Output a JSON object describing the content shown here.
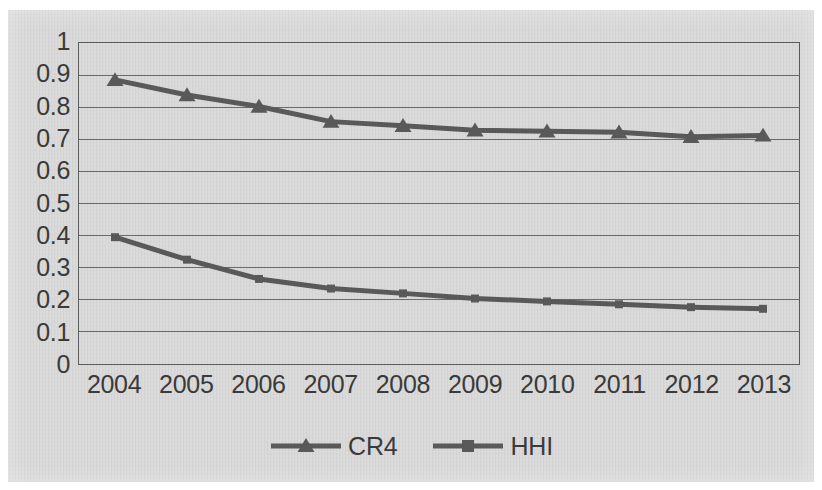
{
  "chart_data": {
    "type": "line",
    "title": "",
    "xlabel": "",
    "ylabel": "",
    "categories": [
      "2004",
      "2005",
      "2006",
      "2007",
      "2008",
      "2009",
      "2010",
      "2011",
      "2012",
      "2013"
    ],
    "series": [
      {
        "name": "CR4",
        "marker": "triangle",
        "color": "#595959",
        "values": [
          0.885,
          0.838,
          0.802,
          0.755,
          0.742,
          0.728,
          0.725,
          0.722,
          0.708,
          0.712
        ]
      },
      {
        "name": "HHI",
        "marker": "square",
        "color": "#595959",
        "values": [
          0.395,
          0.325,
          0.265,
          0.235,
          0.22,
          0.204,
          0.195,
          0.186,
          0.177,
          0.172
        ]
      }
    ],
    "ylim": [
      0,
      1
    ],
    "ytick_labels": [
      "1",
      "0.9",
      "0.8",
      "0.7",
      "0.6",
      "0.5",
      "0.4",
      "0.3",
      "0.2",
      "0.1",
      "0"
    ],
    "ytick_values": [
      1,
      0.9,
      0.8,
      0.7,
      0.6,
      0.5,
      0.4,
      0.3,
      0.2,
      0.1,
      0
    ],
    "grid": true,
    "grid_axis": "y",
    "legend_position": "bottom",
    "line_color": "#595959",
    "grid_color": "#6b6b6b",
    "background_color": "#d4d4d4"
  },
  "legend": {
    "entries": [
      {
        "label": "CR4"
      },
      {
        "label": "HHI"
      }
    ]
  }
}
